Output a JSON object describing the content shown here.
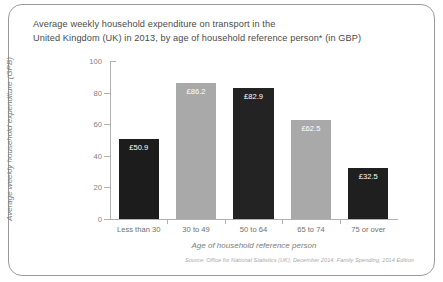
{
  "title": {
    "line1": "Average weekly household expenditure on transport in the",
    "line2": "United Kingdom (UK) in 2013, by age of household reference person* (in GBP)"
  },
  "source": "Source: Office for National Statistics (UK), December 2014, Family Spending, 2014 Edition",
  "chart_data": {
    "type": "bar",
    "title": "Average weekly household expenditure on transport in the United Kingdom (UK) in 2013, by age of household reference person* (in GBP)",
    "xlabel": "Age of household reference person",
    "ylabel": "Average weekly household expenditure (GPB)",
    "ylim": [
      0,
      100
    ],
    "yticks": [
      "0",
      "20",
      "40",
      "60",
      "80",
      "100"
    ],
    "ytick_values": [
      0,
      20,
      40,
      60,
      80,
      100
    ],
    "grid": false,
    "legend": "none",
    "categories": [
      "Less than 30",
      "30 to 49",
      "50 to 64",
      "65 to 74",
      "75 or over"
    ],
    "values": [
      50.9,
      86.2,
      82.9,
      62.5,
      32.5
    ],
    "data_labels": [
      "£50.9",
      "£86.2",
      "£82.9",
      "£62.5",
      "£32.5"
    ],
    "bar_colors": [
      "#1c1c1c",
      "#a9a9a9",
      "#232323",
      "#a9a9a9",
      "#1f1f1f"
    ]
  },
  "colors": {
    "dark_bar": "#1c1c1c",
    "light_bar": "#a9a9a9",
    "axis": "#b0b0b0",
    "text": "#4a4a4a",
    "muted_text": "#7d7d7d",
    "source_text": "#a9a9a9",
    "border": "#9a9a9a"
  }
}
